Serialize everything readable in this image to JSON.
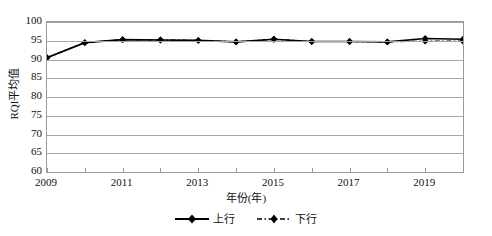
{
  "chart_data": {
    "type": "line",
    "title": "",
    "xlabel": "年份(年)",
    "ylabel": "RQI平均值",
    "x": [
      2009,
      2010,
      2011,
      2012,
      2013,
      2014,
      2015,
      2016,
      2017,
      2018,
      2019,
      2020
    ],
    "xlim": [
      2009,
      2020
    ],
    "ylim": [
      60,
      100
    ],
    "yticks": [
      60,
      65,
      70,
      75,
      80,
      85,
      90,
      95,
      100
    ],
    "xticks": [
      2009,
      2010,
      2011,
      2012,
      2013,
      2014,
      2015,
      2016,
      2017,
      2018,
      2019,
      2020
    ],
    "xtick_labels": [
      "2009",
      "",
      "2011",
      "",
      "2013",
      "",
      "2015",
      "",
      "2017",
      "",
      "2019",
      ""
    ],
    "ytick_labels": [
      "60",
      "65",
      "70",
      "75",
      "80",
      "85",
      "90",
      "95",
      "100"
    ],
    "grid": "horizontal",
    "legend_position": "bottom",
    "series": [
      {
        "name": "上行",
        "style": "solid",
        "marker": "diamond",
        "color": "#000000",
        "values": [
          90.5,
          94.5,
          95.3,
          95.2,
          95.1,
          94.7,
          95.4,
          94.8,
          94.8,
          94.7,
          95.6,
          95.4
        ]
      },
      {
        "name": "下行",
        "style": "dash-dot",
        "marker": "diamond",
        "color": "#000000",
        "values": [
          90.5,
          94.5,
          95.3,
          95.2,
          95.1,
          94.7,
          95.4,
          94.8,
          94.8,
          94.7,
          94.9,
          94.9
        ]
      }
    ]
  },
  "legend": {
    "items": [
      {
        "label": "上行"
      },
      {
        "label": "下行"
      }
    ]
  }
}
